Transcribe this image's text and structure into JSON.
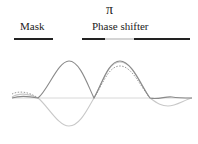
{
  "labels": {
    "mask": "Mask",
    "pi": "π",
    "phase_shifter": "Phase shifter"
  },
  "structure": {
    "mask_bar": {
      "x1": 14,
      "x2": 53
    },
    "phase_bar_left": {
      "x1": 82,
      "x2": 105
    },
    "phase_shifter_region": {
      "x1": 105,
      "x2": 134
    },
    "phase_bar_right": {
      "x1": 134,
      "x2": 190
    }
  },
  "colors": {
    "solid_curve": "#8a8a8a",
    "light_curve": "#c8c8c8",
    "dotted_curve": "#9a9a9a",
    "axis": "#d8d8d8",
    "bar": "#222222",
    "shifter": "#d4d4d4"
  },
  "curves": {
    "axis_y": 98,
    "solid": "Intensity / field amplitude: two positive peaks at x≈69 and x≈120",
    "light": "Phase-shifted field: negative lobe at x≈69, positive lobe at x≈120",
    "dotted": "Resulting intensity: peak near x≈120, reduced side lobes"
  }
}
